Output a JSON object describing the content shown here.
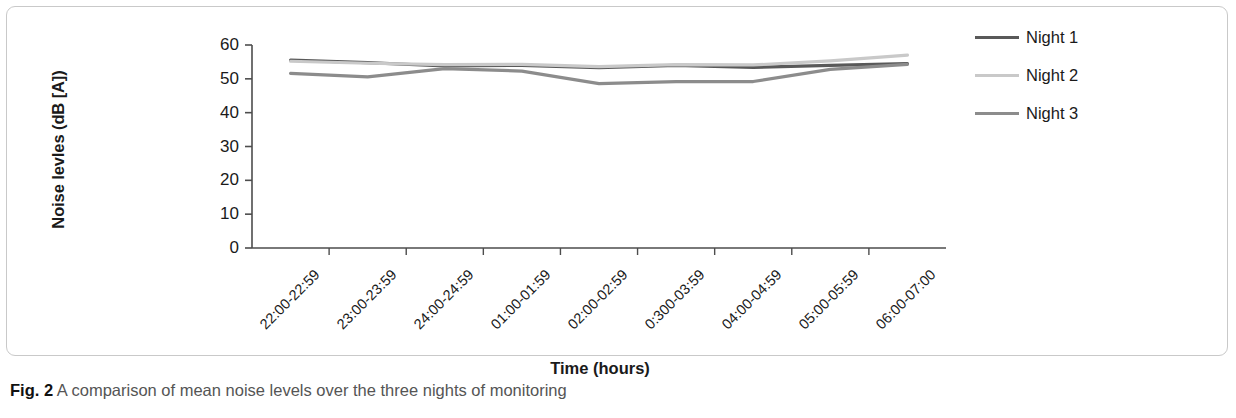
{
  "figure": {
    "caption_label": "Fig. 2",
    "caption_text": "A comparison of mean noise levels over the three nights of monitoring"
  },
  "legend": {
    "position": "right",
    "entries": [
      {
        "label": "Night 1",
        "color": "#595959"
      },
      {
        "label": "Night 2",
        "color": "#c9c9c9"
      },
      {
        "label": "Night 3",
        "color": "#8c8c8c"
      }
    ]
  },
  "axes": {
    "y_title": "Noise levles (dB [A])",
    "x_title": "Time (hours)",
    "y_ticks": [
      "60",
      "50",
      "40",
      "30",
      "20",
      "10",
      "0"
    ],
    "x_ticks": [
      "22:00-22:59",
      "23:00-23:59",
      "24:00-24:59",
      "01:00-01:59",
      "02:00-02:59",
      "0:300-03:59",
      "04:00-04:59",
      "05:00-05:59",
      "06:00-07:00"
    ]
  },
  "chart_data": {
    "type": "line",
    "title": "",
    "subtitle": "",
    "xlabel": "Time (hours)",
    "ylabel": "Noise levles (dB [A])",
    "categories": [
      "22:00-22:59",
      "23:00-23:59",
      "24:00-24:59",
      "01:00-01:59",
      "02:00-02:59",
      "0:300-03:59",
      "04:00-04:59",
      "05:00-05:59",
      "06:00-07:00"
    ],
    "series": [
      {
        "name": "Night 1",
        "color": "#595959",
        "values": [
          55.5,
          54.8,
          53.8,
          54.0,
          53.3,
          54.0,
          53.4,
          54.0,
          54.5
        ]
      },
      {
        "name": "Night 2",
        "color": "#c9c9c9",
        "values": [
          55.2,
          54.6,
          54.2,
          54.3,
          53.6,
          54.2,
          54.1,
          55.3,
          57.0
        ]
      },
      {
        "name": "Night 3",
        "color": "#8c8c8c",
        "values": [
          51.6,
          50.6,
          53.0,
          52.3,
          48.6,
          49.2,
          49.2,
          52.8,
          54.3
        ]
      }
    ],
    "ylim": [
      0,
      60
    ],
    "ytick_step": 10,
    "grid": false,
    "legend_position": "right"
  }
}
